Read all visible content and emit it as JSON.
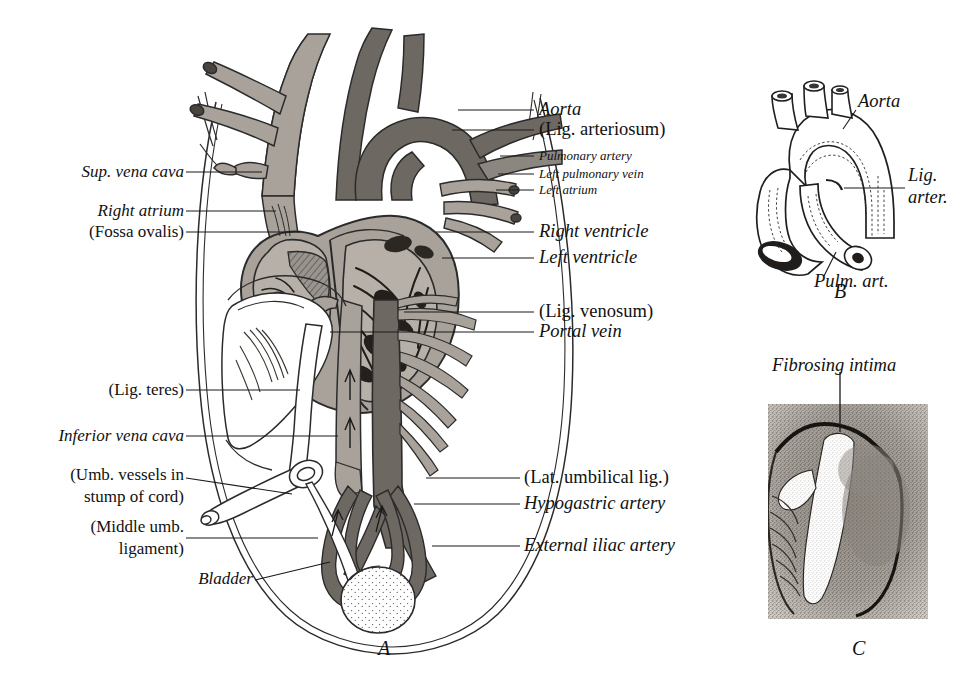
{
  "figure": {
    "panels": [
      {
        "id": "A",
        "label": "A",
        "caption": "Whole-body fetal circulation with heart, great vessels, liver, umbilical vessels and bladder"
      },
      {
        "id": "B",
        "label": "B",
        "caption": "Aortic arch and pulmonary artery with ligamentum arteriosum"
      },
      {
        "id": "C",
        "label": "C",
        "caption": "Histologic section showing fibrosing intima"
      }
    ]
  },
  "panel_a": {
    "labels_left": [
      {
        "key": "sup_vena_cava",
        "text": "Sup. vena cava",
        "style": "italic"
      },
      {
        "key": "right_atrium",
        "text": "Right atrium",
        "style": "italic"
      },
      {
        "key": "fossa_ovalis",
        "text": "(Fossa ovalis)",
        "style": "roman"
      },
      {
        "key": "lig_teres",
        "text": "(Lig. teres)",
        "style": "roman"
      },
      {
        "key": "inferior_vena_cava",
        "text": "Inferior vena cava",
        "style": "italic"
      },
      {
        "key": "umb_vessels_1",
        "text": "(Umb. vessels in",
        "style": "roman"
      },
      {
        "key": "umb_vessels_2",
        "text": "stump of cord)",
        "style": "roman"
      },
      {
        "key": "middle_umb_1",
        "text": "(Middle umb.",
        "style": "roman"
      },
      {
        "key": "middle_umb_2",
        "text": "ligament)",
        "style": "roman"
      },
      {
        "key": "bladder",
        "text": "Bladder",
        "style": "italic"
      }
    ],
    "labels_right": [
      {
        "key": "aorta",
        "text": "Aorta",
        "style": "italic",
        "size": "lg"
      },
      {
        "key": "lig_arteriosum",
        "text": "(Lig. arteriosum)",
        "style": "roman",
        "size": "lg"
      },
      {
        "key": "pulmonary_artery",
        "text": "Pulmonary artery",
        "style": "italic",
        "size": "sm"
      },
      {
        "key": "left_pulmonary_vein",
        "text": "Left pulmonary vein",
        "style": "italic",
        "size": "sm"
      },
      {
        "key": "left_atrium",
        "text": "Left atrium",
        "style": "italic",
        "size": "sm"
      },
      {
        "key": "right_ventricle",
        "text": "Right ventricle",
        "style": "italic",
        "size": "lg"
      },
      {
        "key": "left_ventricle",
        "text": "Left ventricle",
        "style": "italic",
        "size": "lg"
      },
      {
        "key": "lig_venosum",
        "text": "(Lig. venosum)",
        "style": "roman",
        "size": "lg"
      },
      {
        "key": "portal_vein",
        "text": "Portal vein",
        "style": "italic",
        "size": "lg"
      },
      {
        "key": "lat_umbilical_lig",
        "text": "(Lat. umbilical lig.)",
        "style": "roman",
        "size": "lg"
      },
      {
        "key": "hypogastric_artery",
        "text": "Hypogastric artery",
        "style": "italic",
        "size": "lg"
      },
      {
        "key": "external_iliac_artery",
        "text": "External iliac artery",
        "style": "italic",
        "size": "lg"
      }
    ],
    "panel_letter": "A"
  },
  "panel_b": {
    "labels": [
      {
        "key": "aorta",
        "text": "Aorta",
        "style": "italic"
      },
      {
        "key": "lig_arter_1",
        "text": "Lig.",
        "style": "italic"
      },
      {
        "key": "lig_arter_2",
        "text": "arter.",
        "style": "italic"
      },
      {
        "key": "pulm_art",
        "text": "Pulm. art.",
        "style": "italic"
      }
    ],
    "panel_letter": "B"
  },
  "panel_c": {
    "labels": [
      {
        "key": "fibrosing_intima",
        "text": "Fibrosing intima",
        "style": "italic"
      }
    ],
    "panel_letter": "C"
  },
  "colors": {
    "ink": "#1a1a1a",
    "page": "#ffffff",
    "vessel_light": "#a8a29b",
    "vessel_dark": "#6e6862",
    "vessel_mid": "#8c8680",
    "outline": "#2b2b2b",
    "tissue_gray": "#9a948e"
  }
}
